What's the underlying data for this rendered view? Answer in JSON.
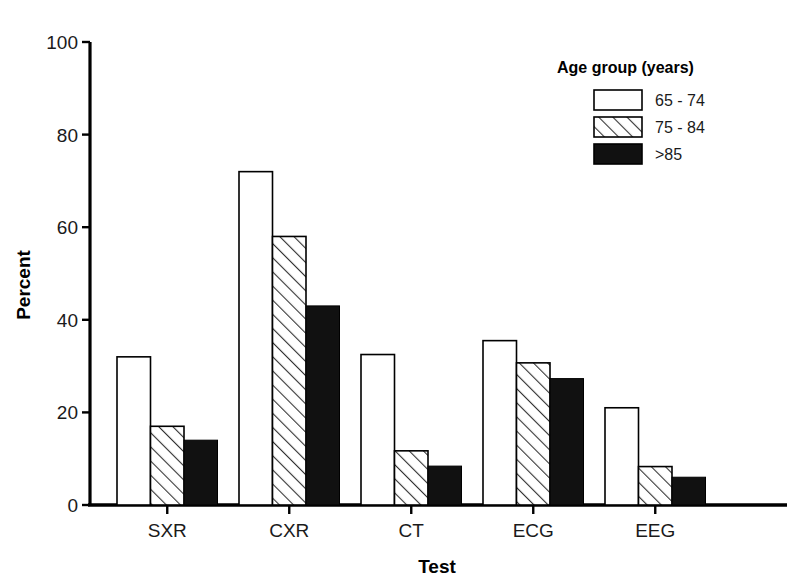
{
  "chart_data": {
    "type": "bar",
    "title": "",
    "xlabel": "Test",
    "ylabel": "Percent",
    "categories": [
      "SXR",
      "CXR",
      "CT",
      "ECG",
      "EEG"
    ],
    "ylim": [
      0,
      100
    ],
    "yticks": [
      0,
      20,
      40,
      60,
      80,
      100
    ],
    "ytick_labels": [
      "0",
      "20",
      "40",
      "60",
      "80",
      "100"
    ],
    "grid": false,
    "legend_position": "top-right",
    "legend_title": "Age group (years)",
    "series": [
      {
        "name": "65 - 74",
        "fill": "white",
        "values": [
          32,
          72,
          32.5,
          35.5,
          21
        ]
      },
      {
        "name": "75 - 84",
        "fill": "hatch",
        "values": [
          17,
          58,
          11.7,
          30.7,
          8.3
        ]
      },
      {
        "name": ">85",
        "fill": "black",
        "values": [
          14,
          43,
          8.4,
          27.3,
          6
        ]
      }
    ],
    "colors": {
      "axis": "#000000",
      "bar_outline": "#000000",
      "bar_white": "#ffffff",
      "bar_black": "#111111",
      "hatch_line": "#333333",
      "text": "#1a1a1a"
    }
  },
  "legend": {
    "title": "Age group (years)",
    "items": [
      {
        "label": "65 - 74",
        "swatch": "white-swatch"
      },
      {
        "label": "75 - 84",
        "swatch": "hatched-swatch"
      },
      {
        "label": ">85",
        "swatch": "black-swatch"
      }
    ]
  },
  "axes": {
    "y_title": "Percent",
    "x_title": "Test",
    "y_ticks": [
      "100",
      "80",
      "60",
      "40",
      "20",
      "0"
    ],
    "x_ticks": [
      "SXR",
      "CXR",
      "CT",
      "ECG",
      "EEG"
    ]
  }
}
